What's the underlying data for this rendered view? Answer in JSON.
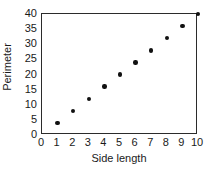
{
  "chart_data": {
    "type": "scatter",
    "title": "",
    "xlabel": "Side length",
    "ylabel": "Perimeter",
    "xlim": [
      0,
      10
    ],
    "ylim": [
      0,
      40
    ],
    "xticks": [
      0,
      1,
      2,
      3,
      4,
      5,
      6,
      7,
      8,
      9,
      10
    ],
    "yticks": [
      0,
      5,
      10,
      15,
      20,
      25,
      30,
      35,
      40
    ],
    "xtick_labels": [
      "0",
      "1",
      "2",
      "3",
      "4",
      "5",
      "6",
      "7",
      "8",
      "9",
      "10"
    ],
    "ytick_labels": [
      "0",
      "5",
      "10",
      "15",
      "20",
      "25",
      "30",
      "35",
      "40"
    ],
    "grid": false,
    "legend": false,
    "frame": "box",
    "marker": "filled-circle",
    "marker_color": "#111111",
    "axis_color": "#2b2b2b",
    "background": "#ffffff",
    "x": [
      1,
      2,
      3,
      4,
      5,
      6,
      7,
      8,
      9,
      10
    ],
    "values": [
      4,
      8,
      12,
      16,
      20,
      24,
      28,
      32,
      36,
      40
    ],
    "points": [
      {
        "x": 1,
        "y": 4
      },
      {
        "x": 2,
        "y": 8
      },
      {
        "x": 3,
        "y": 12
      },
      {
        "x": 4,
        "y": 16
      },
      {
        "x": 5,
        "y": 20
      },
      {
        "x": 6,
        "y": 24
      },
      {
        "x": 7,
        "y": 28
      },
      {
        "x": 8,
        "y": 32
      },
      {
        "x": 9,
        "y": 36
      },
      {
        "x": 10,
        "y": 40
      }
    ]
  }
}
